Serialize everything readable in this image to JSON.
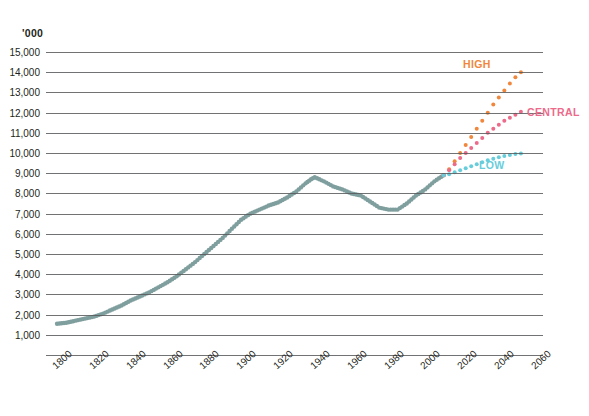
{
  "top_caption": "",
  "units_label": "'000",
  "axis": {
    "y_ticks": [
      "1,000",
      "2,000",
      "3,000",
      "4,000",
      "5,000",
      "6,000",
      "7,000",
      "8,000",
      "9,000",
      "10,000",
      "11,000",
      "12,000",
      "13,000",
      "14,000",
      "15,000"
    ],
    "x_ticks": [
      "1800",
      "1820",
      "1840",
      "1860",
      "1880",
      "1900",
      "1920",
      "1940",
      "1960",
      "1980",
      "2000",
      "2020",
      "2040",
      "2060"
    ]
  },
  "labels": {
    "high": "HIGH",
    "central": "CENTRAL",
    "low": "LOW"
  },
  "colors": {
    "historic": "#7f9e9e",
    "high": "#f0873c",
    "central": "#ec6a8a",
    "low": "#67cddb",
    "grid": "#58595b",
    "text": "#231f20"
  },
  "chart_data": {
    "type": "line",
    "title": "",
    "subtitle": "",
    "xlabel": "",
    "ylabel": "'000",
    "xlim": [
      1795,
      2065
    ],
    "ylim": [
      0,
      15500
    ],
    "grid": true,
    "legend_position": "inline-right",
    "y_ticks": [
      1000,
      2000,
      3000,
      4000,
      5000,
      6000,
      7000,
      8000,
      9000,
      10000,
      11000,
      12000,
      13000,
      14000,
      15000
    ],
    "x_ticks": [
      1800,
      1820,
      1840,
      1860,
      1880,
      1900,
      1920,
      1940,
      1960,
      1980,
      2000,
      2020,
      2040,
      2060
    ],
    "series": [
      {
        "name": "Historic",
        "style": "dotted-thick",
        "color": "#7f9e9e",
        "x": [
          1801,
          1806,
          1811,
          1816,
          1821,
          1826,
          1831,
          1836,
          1841,
          1846,
          1851,
          1856,
          1861,
          1866,
          1871,
          1876,
          1881,
          1886,
          1891,
          1896,
          1901,
          1906,
          1911,
          1916,
          1921,
          1926,
          1931,
          1936,
          1939,
          1941,
          1946,
          1951,
          1956,
          1961,
          1966,
          1971,
          1976,
          1981,
          1986,
          1991,
          1996,
          2001,
          2006,
          2011
        ],
        "y": [
          1550,
          1600,
          1700,
          1800,
          1900,
          2050,
          2250,
          2450,
          2700,
          2900,
          3100,
          3350,
          3600,
          3900,
          4250,
          4600,
          5000,
          5400,
          5800,
          6250,
          6700,
          7000,
          7200,
          7400,
          7550,
          7800,
          8100,
          8500,
          8700,
          8800,
          8600,
          8350,
          8200,
          8000,
          7900,
          7600,
          7300,
          7200,
          7200,
          7500,
          7900,
          8200,
          8600,
          8900
        ],
        "note": "Greater London historic population"
      },
      {
        "name": "HIGH",
        "style": "dotted",
        "color": "#f0873c",
        "x": [
          2011,
          2014,
          2017,
          2020,
          2023,
          2026,
          2029,
          2032,
          2035,
          2038,
          2041,
          2044,
          2047,
          2050,
          2053
        ],
        "y": [
          8900,
          9200,
          9600,
          10000,
          10400,
          10800,
          11200,
          11600,
          12000,
          12400,
          12750,
          13100,
          13450,
          13750,
          14000
        ]
      },
      {
        "name": "CENTRAL",
        "style": "dotted",
        "color": "#ec6a8a",
        "x": [
          2011,
          2014,
          2017,
          2020,
          2023,
          2026,
          2029,
          2032,
          2035,
          2038,
          2041,
          2044,
          2047,
          2050,
          2053
        ],
        "y": [
          8900,
          9150,
          9450,
          9750,
          10000,
          10250,
          10500,
          10750,
          11000,
          11200,
          11400,
          11600,
          11750,
          11900,
          12050
        ]
      },
      {
        "name": "LOW",
        "style": "dotted",
        "color": "#67cddb",
        "x": [
          2011,
          2014,
          2017,
          2020,
          2023,
          2026,
          2029,
          2032,
          2035,
          2038,
          2041,
          2044,
          2047,
          2050,
          2053
        ],
        "y": [
          8900,
          8950,
          9050,
          9150,
          9250,
          9350,
          9450,
          9550,
          9650,
          9720,
          9790,
          9850,
          9900,
          9950,
          9980
        ]
      }
    ]
  }
}
